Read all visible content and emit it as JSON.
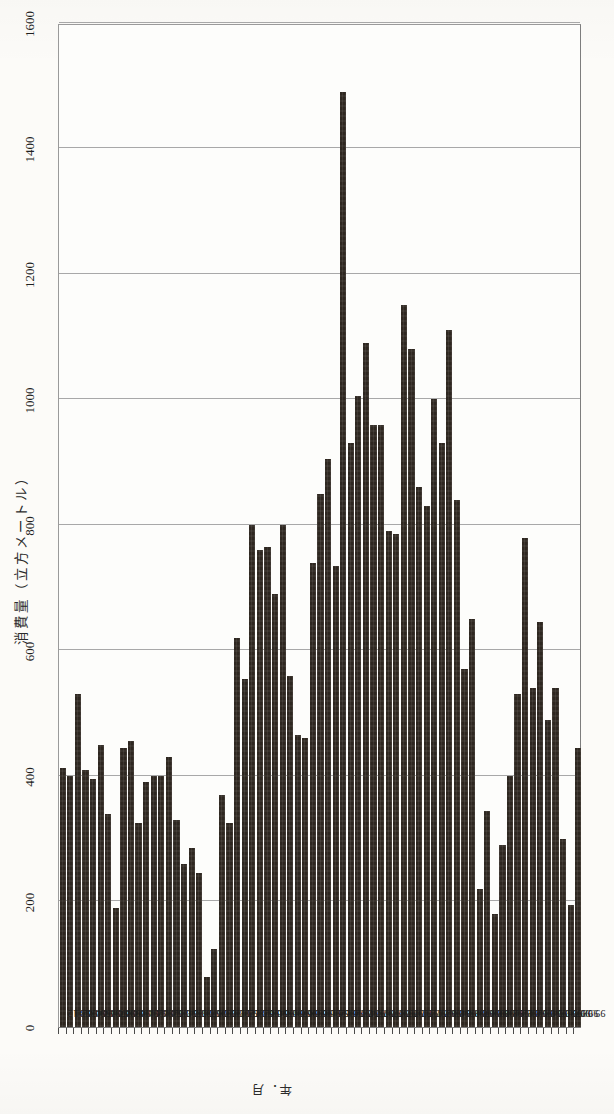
{
  "chart_data": {
    "type": "bar",
    "orientation": "horizontal",
    "title": "消費量（立方メートル）",
    "ylabel": "消費量（立方メートル）",
    "xlabel": "年．月",
    "xlim": [
      0,
      1600
    ],
    "tick_values": [
      0,
      200,
      400,
      600,
      800,
      1000,
      1200,
      1400,
      1600
    ],
    "tick_labels": [
      "0",
      "200",
      "400",
      "600",
      "800",
      "1000",
      "1200",
      "1400",
      "1600"
    ],
    "grid": true,
    "legend": "none",
    "categories": [
      "93.12",
      "94.01",
      "94.02",
      "94.03",
      "94.04",
      "94.05",
      "94.06",
      "94.07",
      "94.08",
      "94.09",
      "94.10",
      "94.11",
      "94.12",
      "95.01",
      "95.02",
      "95.03",
      "95.04",
      "95.05",
      "95.06",
      "95.07",
      "95.08",
      "95.09",
      "95.10",
      "95.11",
      "95.12",
      "96.01",
      "96.02",
      "96.03",
      "96.04",
      "96.05",
      "96.06",
      "96.07",
      "96.08",
      "96.09",
      "96.10",
      "96.11",
      "96.12",
      "97.01",
      "97.02",
      "97.03",
      "97.04",
      "97.05",
      "97.06",
      "97.07",
      "97.08",
      "97.09",
      "97.10",
      "97.11",
      "97.12",
      "98.01",
      "98.02",
      "98.03",
      "98.04",
      "98.05",
      "98.06",
      "98.07",
      "98.08",
      "98.09",
      "98.10",
      "98.11",
      "98.12",
      "99.01",
      "99.02",
      "99.03",
      "99.04",
      "99.05",
      "99.06",
      "99.07",
      "99.08"
    ],
    "values": [
      412,
      400,
      530,
      410,
      395,
      450,
      340,
      190,
      445,
      455,
      325,
      390,
      400,
      400,
      430,
      330,
      260,
      285,
      245,
      80,
      125,
      370,
      325,
      620,
      555,
      800,
      760,
      765,
      690,
      800,
      560,
      465,
      460,
      740,
      850,
      905,
      735,
      1490,
      930,
      1005,
      1090,
      960,
      960,
      790,
      785,
      1150,
      1080,
      860,
      830,
      1000,
      930,
      1110,
      840,
      570,
      650,
      220,
      345,
      180,
      290,
      400,
      530,
      780,
      540,
      645,
      490,
      540,
      300,
      195,
      445
    ],
    "bar_color": "#2e2720",
    "n_bars": 69
  },
  "axis": {
    "value_axis_title": "消費量（立方メートル）",
    "category_axis_title": "年．月",
    "ticks": [
      "0",
      "200",
      "400",
      "600",
      "800",
      "1000",
      "1200",
      "1400",
      "1600"
    ]
  }
}
